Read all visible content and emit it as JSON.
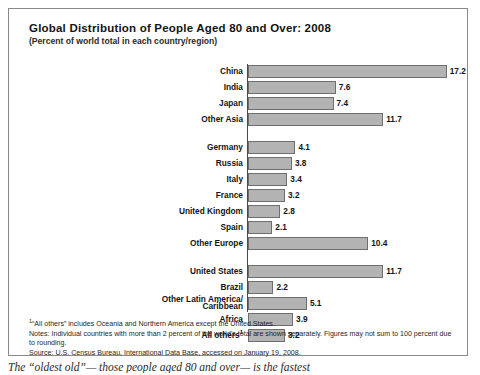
{
  "chart_data": {
    "type": "bar",
    "orientation": "horizontal",
    "title": "Global Distribution of People Aged 80 and Over: 2008",
    "subtitle": "(Percent of world total in each country/region)",
    "xlabel": "",
    "ylabel": "",
    "xlim": [
      0,
      18
    ],
    "grid": false,
    "legend": null,
    "categories": [
      "China",
      "India",
      "Japan",
      "Other Asia",
      "Germany",
      "Russia",
      "Italy",
      "France",
      "United Kingdom",
      "Spain",
      "Other Europe",
      "United States",
      "Brazil",
      "Other Latin America/Caribbean",
      "Africa",
      "All others"
    ],
    "values": [
      17.2,
      7.6,
      7.4,
      11.7,
      4.1,
      3.8,
      3.4,
      3.2,
      2.8,
      2.1,
      10.4,
      11.7,
      2.2,
      5.1,
      3.9,
      3.2
    ],
    "groups": [
      {
        "name": "asia",
        "rows": [
          {
            "label": "China",
            "value": 17.2,
            "value_text": "17.2",
            "footnote": ""
          },
          {
            "label": "India",
            "value": 7.6,
            "value_text": "7.6",
            "footnote": ""
          },
          {
            "label": "Japan",
            "value": 7.4,
            "value_text": "7.4",
            "footnote": ""
          },
          {
            "label": "Other Asia",
            "value": 11.7,
            "value_text": "11.7",
            "footnote": ""
          }
        ]
      },
      {
        "name": "europe",
        "rows": [
          {
            "label": "Germany",
            "value": 4.1,
            "value_text": "4.1",
            "footnote": ""
          },
          {
            "label": "Russia",
            "value": 3.8,
            "value_text": "3.8",
            "footnote": ""
          },
          {
            "label": "Italy",
            "value": 3.4,
            "value_text": "3.4",
            "footnote": ""
          },
          {
            "label": "France",
            "value": 3.2,
            "value_text": "3.2",
            "footnote": ""
          },
          {
            "label": "United Kingdom",
            "value": 2.8,
            "value_text": "2.8",
            "footnote": ""
          },
          {
            "label": "Spain",
            "value": 2.1,
            "value_text": "2.1",
            "footnote": ""
          },
          {
            "label": "Other Europe",
            "value": 10.4,
            "value_text": "10.4",
            "footnote": ""
          }
        ]
      },
      {
        "name": "americas-africa-other",
        "rows": [
          {
            "label": "United States",
            "value": 11.7,
            "value_text": "11.7",
            "footnote": ""
          },
          {
            "label": "Brazil",
            "value": 2.2,
            "value_text": "2.2",
            "footnote": ""
          },
          {
            "label": "Other Latin America/\nCaribbean",
            "value": 5.1,
            "value_text": "5.1",
            "footnote": ""
          },
          {
            "label": "Africa",
            "value": 3.9,
            "value_text": "3.9",
            "footnote": ""
          },
          {
            "label": "All others",
            "value": 3.2,
            "value_text": "3.2",
            "footnote": "1"
          }
        ]
      }
    ],
    "bar_color": "#b3b3b3",
    "bar_border_color": "#6e6e6e"
  },
  "notes": {
    "footnote_marker": "1",
    "footnote": "“All others” includes Oceania and Northern America except the United States.",
    "note_line": "Notes: Individual countries with more than 2 percent of the world's total are shown separately. Figures may not sum to 100 percent due to rounding.",
    "source_line": "Source:  U.S. Census Bureau, International Data Base, accessed on January 19, 2008."
  },
  "body_text": "The “oldest old”— those people aged 80 and over— is the fastest"
}
